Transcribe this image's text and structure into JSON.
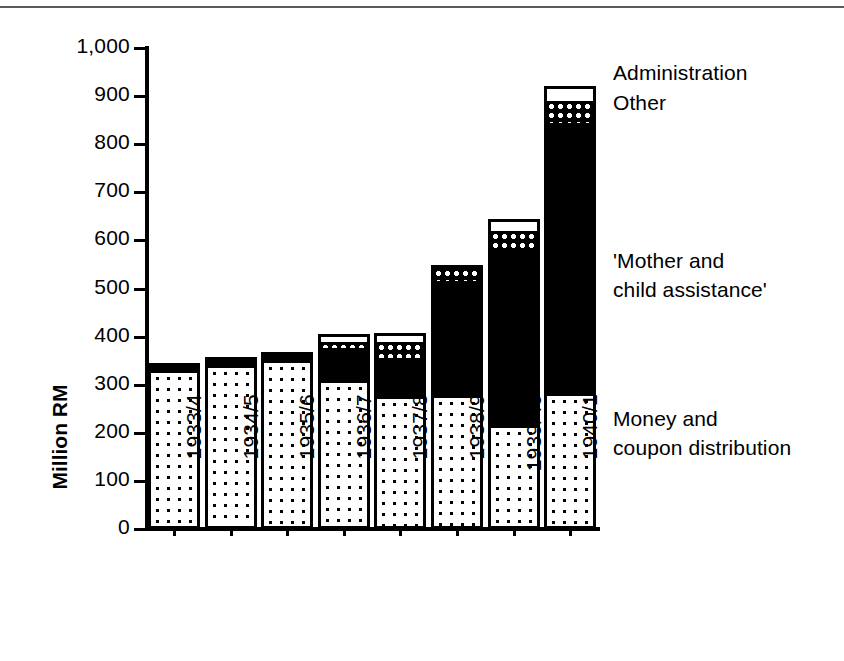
{
  "chart_data": {
    "type": "bar",
    "subtype": "stacked-bar",
    "title": "",
    "xlabel": "",
    "ylabel": "Million RM",
    "ylim": [
      0,
      1000
    ],
    "ytick_values": [
      0,
      100,
      200,
      300,
      400,
      500,
      600,
      700,
      800,
      900,
      1000
    ],
    "ytick_labels": [
      "0",
      "100",
      "200",
      "300",
      "400",
      "500",
      "600",
      "700",
      "800",
      "900",
      "1,000"
    ],
    "grid": false,
    "legend_position": "inline-right-annotations",
    "categories": [
      "1933/4",
      "1934/5",
      "1935/6",
      "1936/7",
      "1937/8",
      "1938/9",
      "1939/40",
      "1940/1"
    ],
    "series": [
      {
        "name": "Money and coupon distribution",
        "pattern": "dotted",
        "values": [
          333,
          344,
          353,
          311,
          278,
          281,
          219,
          284
        ]
      },
      {
        "name": "'Mother and child assistance'",
        "pattern": "solid-black",
        "values": [
          13,
          13,
          14,
          71,
          83,
          240,
          369,
          567
        ]
      },
      {
        "name": "Other",
        "pattern": "checkered",
        "values": [
          0,
          0,
          0,
          14,
          35,
          28,
          37,
          46
        ]
      },
      {
        "name": "Administration",
        "pattern": "white",
        "values": [
          0,
          0,
          0,
          10,
          11,
          8,
          19,
          23
        ]
      }
    ],
    "totals": [
      346,
      357,
      367,
      406,
      407,
      549,
      644,
      920
    ],
    "annotations": [
      {
        "id": "administration",
        "text": "Administration"
      },
      {
        "id": "other",
        "text": "Other"
      },
      {
        "id": "mother-and-child",
        "text": "'Mother and\nchild assistance'"
      },
      {
        "id": "money-and-coupon",
        "text": "Money and\ncoupon distribution"
      }
    ],
    "colors": {
      "ink": "#000000",
      "paper": "#ffffff",
      "rule": "#5a5a5a"
    }
  }
}
